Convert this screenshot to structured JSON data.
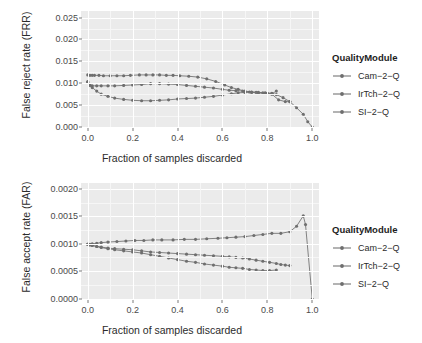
{
  "legend": {
    "title": "QualityModule",
    "items": [
      {
        "label": "Cam−2−Q",
        "color": "#737373"
      },
      {
        "label": "IrTch−2−Q",
        "color": "#737373"
      },
      {
        "label": "SI−2−Q",
        "color": "#737373"
      }
    ]
  },
  "chart_data": [
    {
      "type": "line",
      "id": "frr",
      "title": "",
      "xlabel": "Fraction of samples discarded",
      "ylabel": "False reject rate (FRR)",
      "xlim": [
        -0.03,
        1.03
      ],
      "ylim": [
        0.0,
        0.0265
      ],
      "xticks": [
        0.0,
        0.2,
        0.4,
        0.6,
        0.8,
        1.0
      ],
      "xticklabels": [
        "0.0",
        "0.2",
        "0.4",
        "0.6",
        "0.8",
        "1.0"
      ],
      "yticks": [
        0.0,
        0.005,
        0.01,
        0.015,
        0.02,
        0.025
      ],
      "yticklabels": [
        "0.000",
        "0.005",
        "0.010",
        "0.015",
        "0.020",
        "0.025"
      ],
      "grid": true,
      "legend_position": "right",
      "series": [
        {
          "name": "Cam−2−Q",
          "color": "#757575",
          "x": [
            0.0,
            0.01,
            0.02,
            0.03,
            0.05,
            0.07,
            0.1,
            0.13,
            0.16,
            0.19,
            0.23,
            0.26,
            0.29,
            0.32,
            0.35,
            0.38,
            0.41,
            0.45,
            0.49,
            0.53,
            0.57,
            0.61,
            0.64,
            0.67,
            0.7,
            0.73,
            0.76,
            0.79,
            0.82,
            0.84,
            0.87,
            0.9,
            0.93,
            0.96,
            0.98,
            1.0
          ],
          "y": [
            0.0119,
            0.0118,
            0.0118,
            0.0118,
            0.0118,
            0.0117,
            0.0117,
            0.0117,
            0.0117,
            0.0118,
            0.0119,
            0.0119,
            0.0119,
            0.0119,
            0.0118,
            0.0118,
            0.0117,
            0.0116,
            0.0114,
            0.011,
            0.0104,
            0.0096,
            0.009,
            0.0086,
            0.0082,
            0.008,
            0.0079,
            0.0078,
            0.0077,
            0.0074,
            0.0067,
            0.0058,
            0.0044,
            0.0029,
            0.0012,
            0.0
          ]
        },
        {
          "name": "IrTch−2−Q",
          "color": "#757575",
          "x": [
            0.0,
            0.01,
            0.02,
            0.04,
            0.06,
            0.09,
            0.12,
            0.16,
            0.2,
            0.24,
            0.28,
            0.32,
            0.36,
            0.4,
            0.44,
            0.48,
            0.52,
            0.56,
            0.6,
            0.63,
            0.66,
            0.69,
            0.72,
            0.75,
            0.78,
            0.8,
            0.82,
            0.84
          ],
          "y": [
            0.0102,
            0.0096,
            0.0094,
            0.0094,
            0.0094,
            0.0094,
            0.0094,
            0.0095,
            0.0096,
            0.0097,
            0.0099,
            0.0099,
            0.0098,
            0.0097,
            0.0095,
            0.0093,
            0.0091,
            0.0089,
            0.0086,
            0.0084,
            0.0083,
            0.0082,
            0.008,
            0.0079,
            0.0078,
            0.0077,
            0.0076,
            0.0082
          ]
        },
        {
          "name": "SI−2−Q",
          "color": "#757575",
          "x": [
            0.0,
            0.01,
            0.02,
            0.04,
            0.06,
            0.09,
            0.12,
            0.16,
            0.2,
            0.24,
            0.28,
            0.32,
            0.36,
            0.4,
            0.44,
            0.48,
            0.52,
            0.56,
            0.6,
            0.64,
            0.67,
            0.7,
            0.73,
            0.76,
            0.79,
            0.82,
            0.85,
            0.88,
            0.9
          ],
          "y": [
            0.0104,
            0.0095,
            0.009,
            0.0082,
            0.0075,
            0.007,
            0.0066,
            0.0063,
            0.0061,
            0.006,
            0.006,
            0.0061,
            0.0062,
            0.0064,
            0.0065,
            0.0066,
            0.0068,
            0.007,
            0.0073,
            0.0076,
            0.0078,
            0.0079,
            0.0079,
            0.0078,
            0.0077,
            0.0075,
            0.0062,
            0.0058,
            0.0058
          ]
        }
      ]
    },
    {
      "type": "line",
      "id": "far",
      "title": "",
      "xlabel": "Fraction of samples discarded",
      "ylabel": "False accept rate (FAR)",
      "xlim": [
        -0.03,
        1.03
      ],
      "ylim": [
        0.0,
        0.00212
      ],
      "xticks": [
        0.0,
        0.2,
        0.4,
        0.6,
        0.8,
        1.0
      ],
      "xticklabels": [
        "0.0",
        "0.2",
        "0.4",
        "0.6",
        "0.8",
        "1.0"
      ],
      "yticks": [
        0.0,
        0.0005,
        0.001,
        0.0015,
        0.002
      ],
      "yticklabels": [
        "0.0000",
        "0.0005",
        "0.0010",
        "0.0015",
        "0.0020"
      ],
      "grid": true,
      "legend_position": "right",
      "series": [
        {
          "name": "Cam−2−Q",
          "color": "#757575",
          "x": [
            0.0,
            0.01,
            0.02,
            0.04,
            0.06,
            0.09,
            0.13,
            0.17,
            0.21,
            0.25,
            0.29,
            0.33,
            0.38,
            0.43,
            0.48,
            0.53,
            0.58,
            0.62,
            0.66,
            0.7,
            0.74,
            0.78,
            0.82,
            0.86,
            0.9,
            0.93,
            0.96,
            0.97,
            1.0
          ],
          "y": [
            0.001,
            0.001,
            0.00101,
            0.00102,
            0.00103,
            0.00104,
            0.00105,
            0.00106,
            0.00107,
            0.00107,
            0.00108,
            0.00108,
            0.00108,
            0.00109,
            0.00109,
            0.0011,
            0.00111,
            0.00112,
            0.00113,
            0.00114,
            0.00116,
            0.00118,
            0.0012,
            0.0012,
            0.00123,
            0.00133,
            0.00152,
            0.00136,
            0.0
          ]
        },
        {
          "name": "IrTch−2−Q",
          "color": "#757575",
          "x": [
            0.0,
            0.01,
            0.02,
            0.04,
            0.06,
            0.09,
            0.12,
            0.16,
            0.2,
            0.24,
            0.28,
            0.32,
            0.36,
            0.4,
            0.44,
            0.48,
            0.52,
            0.56,
            0.6,
            0.63,
            0.66,
            0.69,
            0.72,
            0.75,
            0.78,
            0.81,
            0.84,
            0.86,
            0.88,
            0.9
          ],
          "y": [
            0.001,
            0.00099,
            0.00098,
            0.00096,
            0.00095,
            0.00093,
            0.00092,
            0.00091,
            0.0009,
            0.00088,
            0.00086,
            0.00085,
            0.00084,
            0.00083,
            0.00082,
            0.00081,
            0.0008,
            0.00079,
            0.00078,
            0.00077,
            0.00076,
            0.00075,
            0.00073,
            0.00071,
            0.00069,
            0.00067,
            0.00065,
            0.00063,
            0.00062,
            0.00061
          ]
        },
        {
          "name": "SI−2−Q",
          "color": "#757575",
          "x": [
            0.0,
            0.01,
            0.02,
            0.04,
            0.06,
            0.09,
            0.12,
            0.16,
            0.2,
            0.24,
            0.28,
            0.32,
            0.36,
            0.4,
            0.44,
            0.48,
            0.52,
            0.56,
            0.6,
            0.63,
            0.66,
            0.69,
            0.72,
            0.75,
            0.78,
            0.81,
            0.84
          ],
          "y": [
            0.001,
            0.00099,
            0.00098,
            0.00096,
            0.00094,
            0.00092,
            0.0009,
            0.00088,
            0.00086,
            0.00084,
            0.00081,
            0.00078,
            0.00075,
            0.00072,
            0.00069,
            0.00067,
            0.00064,
            0.00062,
            0.0006,
            0.00058,
            0.00057,
            0.00056,
            0.00054,
            0.00053,
            0.00052,
            0.00052,
            0.00053
          ]
        }
      ]
    }
  ]
}
